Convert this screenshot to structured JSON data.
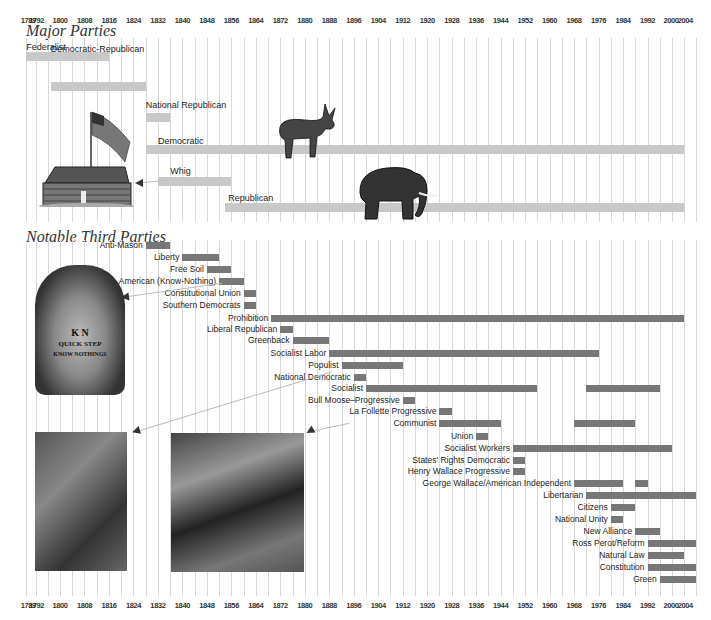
{
  "chart_data": {
    "type": "timeline-bar",
    "title": "",
    "xlabel": "",
    "ylabel": "",
    "xlim": [
      1789,
      2008
    ],
    "tick_labels": [
      "1789",
      "1792",
      "1800",
      "1808",
      "1816",
      "1824",
      "1832",
      "1840",
      "1848",
      "1856",
      "1864",
      "1872",
      "1880",
      "1888",
      "1896",
      "1904",
      "1912",
      "1920",
      "1928",
      "1936",
      "1944",
      "1952",
      "1960",
      "1968",
      "1976",
      "1984",
      "1992",
      "2000",
      "2004"
    ],
    "sections": [
      {
        "title": "Major Parties",
        "series": [
          {
            "name": "Federalist",
            "spans": [
              [
                1789,
                1816
              ]
            ]
          },
          {
            "name": "Democratic-Republican",
            "spans": [
              [
                1797,
                1828
              ]
            ]
          },
          {
            "name": "National Republican",
            "spans": [
              [
                1828,
                1836
              ]
            ]
          },
          {
            "name": "Democratic",
            "spans": [
              [
                1828,
                2004
              ]
            ]
          },
          {
            "name": "Whig",
            "spans": [
              [
                1832,
                1856
              ]
            ]
          },
          {
            "name": "Republican",
            "spans": [
              [
                1854,
                2004
              ]
            ]
          }
        ]
      },
      {
        "title": "Notable Third Parties",
        "series": [
          {
            "name": "Anti-Mason",
            "spans": [
              [
                1828,
                1836
              ]
            ]
          },
          {
            "name": "Liberty",
            "spans": [
              [
                1840,
                1852
              ]
            ]
          },
          {
            "name": "Free Soil",
            "spans": [
              [
                1848,
                1856
              ]
            ]
          },
          {
            "name": "American (Know-Nothing)",
            "spans": [
              [
                1852,
                1860
              ]
            ]
          },
          {
            "name": "Constitutional Union",
            "spans": [
              [
                1860,
                1864
              ]
            ]
          },
          {
            "name": "Southern Democrats",
            "spans": [
              [
                1860,
                1864
              ]
            ]
          },
          {
            "name": "Prohibition",
            "spans": [
              [
                1869,
                2004
              ]
            ]
          },
          {
            "name": "Liberal Republican",
            "spans": [
              [
                1872,
                1876
              ]
            ]
          },
          {
            "name": "Greenback",
            "spans": [
              [
                1876,
                1888
              ]
            ]
          },
          {
            "name": "Socialist Labor",
            "spans": [
              [
                1888,
                1976
              ]
            ]
          },
          {
            "name": "Populist",
            "spans": [
              [
                1892,
                1912
              ]
            ]
          },
          {
            "name": "National Democratic",
            "spans": [
              [
                1896,
                1900
              ]
            ]
          },
          {
            "name": "Socialist",
            "spans": [
              [
                1900,
                1956
              ],
              [
                1972,
                1996
              ]
            ]
          },
          {
            "name": "Bull Moose–Progressive",
            "spans": [
              [
                1912,
                1916
              ]
            ]
          },
          {
            "name": "La Follette Progressive",
            "spans": [
              [
                1924,
                1928
              ]
            ]
          },
          {
            "name": "Communist",
            "spans": [
              [
                1924,
                1944
              ],
              [
                1968,
                1988
              ]
            ]
          },
          {
            "name": "Union",
            "spans": [
              [
                1936,
                1940
              ]
            ]
          },
          {
            "name": "Socialist Workers",
            "spans": [
              [
                1948,
                2000
              ]
            ]
          },
          {
            "name": "States' Rights Democratic",
            "spans": [
              [
                1948,
                1952
              ]
            ]
          },
          {
            "name": "Henry Wallace Progressive",
            "spans": [
              [
                1948,
                1952
              ]
            ]
          },
          {
            "name": "George Wallace/American Independent",
            "spans": [
              [
                1968,
                1984
              ],
              [
                1988,
                1992
              ]
            ]
          },
          {
            "name": "Libertarian",
            "spans": [
              [
                1972,
                2008
              ]
            ]
          },
          {
            "name": "Citizens",
            "spans": [
              [
                1980,
                1988
              ]
            ]
          },
          {
            "name": "National Unity",
            "spans": [
              [
                1980,
                1984
              ]
            ]
          },
          {
            "name": "New Alliance",
            "spans": [
              [
                1988,
                1996
              ]
            ]
          },
          {
            "name": "Ross Perot/Reform",
            "spans": [
              [
                1992,
                2008
              ]
            ]
          },
          {
            "name": "Natural Law",
            "spans": [
              [
                1992,
                2004
              ]
            ]
          },
          {
            "name": "Constitution",
            "spans": [
              [
                1992,
                2008
              ]
            ]
          },
          {
            "name": "Green",
            "spans": [
              [
                1996,
                2008
              ]
            ]
          }
        ]
      }
    ],
    "grid": true,
    "colors": {
      "major": "#c8c8c8",
      "third": "#777777",
      "grid": "#d8d8d8"
    }
  },
  "sections": {
    "major_title": "Major Parties",
    "third_title": "Notable Third Parties"
  },
  "illustrations": [
    {
      "name": "log-cabin-with-flag",
      "points_to": "Whig"
    },
    {
      "name": "donkey",
      "near": "Democratic"
    },
    {
      "name": "elephant",
      "near": "Republican"
    },
    {
      "name": "know-nothing-sheet-music",
      "text": [
        "K N",
        "QUICK STEP",
        "KNOW NOTHINGS"
      ],
      "points_to": "American (Know-Nothing)"
    },
    {
      "name": "photo-socialist-candidate",
      "points_to": "Socialist"
    },
    {
      "name": "photo-two-men-talking",
      "points_to": "La Follette Progressive"
    }
  ]
}
